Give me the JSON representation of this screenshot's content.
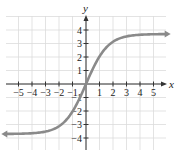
{
  "chart_data": {
    "type": "line",
    "title": "",
    "xlabel": "x",
    "ylabel": "y",
    "xlim": [
      -6,
      6
    ],
    "ylim": [
      -5,
      5
    ],
    "grid": true,
    "x_ticks": [
      -5,
      -4,
      -3,
      -2,
      -1,
      1,
      2,
      3,
      4,
      5
    ],
    "x_tick_labels": [
      "−5",
      "−4",
      "−3",
      "−2",
      "−1",
      "1",
      "2",
      "3",
      "4",
      "5"
    ],
    "y_ticks": [
      -4,
      -3,
      -2,
      -1,
      1,
      2,
      3,
      4
    ],
    "y_tick_labels": [
      "−4",
      "−3",
      "−2",
      "−1",
      "1",
      "2",
      "3",
      "4"
    ],
    "series": [
      {
        "name": "curve",
        "description": "increasing S-shaped curve through origin with horizontal asymptotes near y = ±3.7, arrows at both ends",
        "x": [
          -6,
          -5,
          -4,
          -3,
          -2,
          -1,
          -0.5,
          0,
          0.5,
          1,
          2,
          3,
          4,
          5,
          6
        ],
        "y": [
          -3.6,
          -3.5,
          -3.4,
          -3.2,
          -2.8,
          -2.0,
          -1.0,
          0,
          1.0,
          2.0,
          2.8,
          3.2,
          3.4,
          3.5,
          3.6
        ],
        "color": "#8a8a8a"
      }
    ]
  },
  "colors": {
    "grid": "#dcdcdc",
    "axis": "#333333",
    "curve": "#8a8a8a"
  }
}
